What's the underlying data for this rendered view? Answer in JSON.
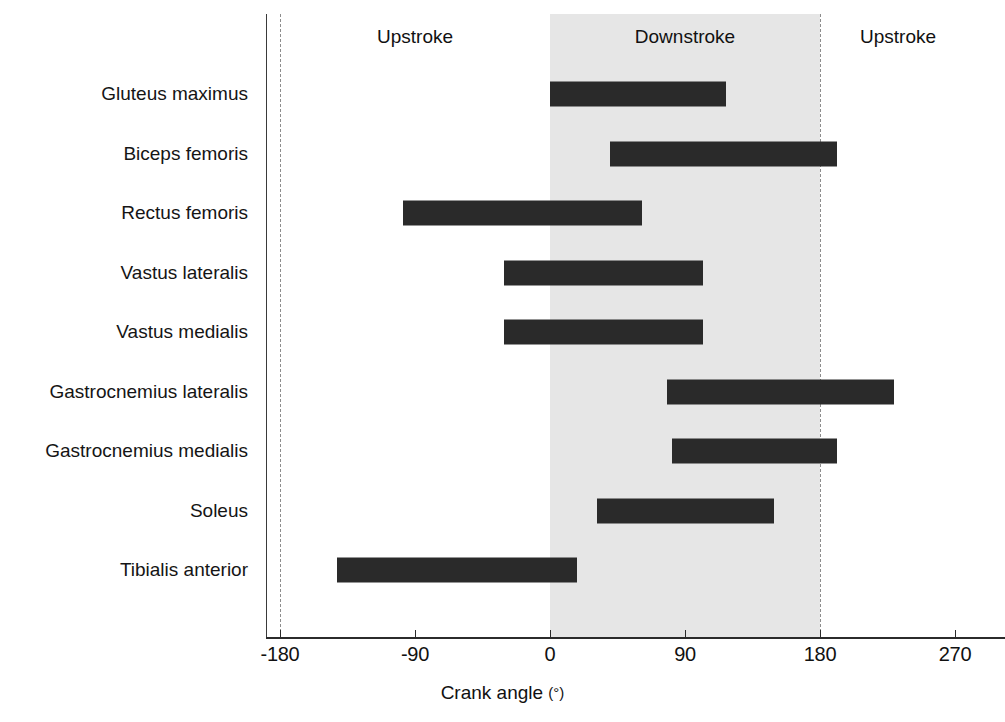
{
  "chart_data": {
    "type": "bar",
    "orientation": "horizontal-range",
    "title": "",
    "xlabel": "Crank angle (°)",
    "ylabel": "",
    "xlim": [
      -210,
      300
    ],
    "xticks": [
      -180,
      -90,
      0,
      90,
      180,
      270
    ],
    "xticklabels": [
      "-180",
      "-90",
      "0",
      "90",
      "180",
      "270"
    ],
    "grid": false,
    "legend": null,
    "categories": [
      "Gluteus maximus",
      "Biceps femoris",
      "Rectus femoris",
      "Vastus lateralis",
      "Vastus medialis",
      "Gastrocnemius lateralis",
      "Gastrocnemius medialis",
      "Soleus",
      "Tibialis anterior"
    ],
    "bars": [
      {
        "label": "Gluteus maximus",
        "start": 0,
        "end": 117
      },
      {
        "label": "Biceps femoris",
        "start": 40,
        "end": 191
      },
      {
        "label": "Rectus femoris",
        "start": -98,
        "end": 61
      },
      {
        "label": "Vastus lateralis",
        "start": -31,
        "end": 102
      },
      {
        "label": "Vastus medialis",
        "start": -31,
        "end": 102
      },
      {
        "label": "Gastrocnemius lateralis",
        "start": 78,
        "end": 229
      },
      {
        "label": "Gastrocnemius medialis",
        "start": 81,
        "end": 191
      },
      {
        "label": "Soleus",
        "start": 31,
        "end": 149
      },
      {
        "label": "Tibialis anterior",
        "start": -142,
        "end": 18
      }
    ],
    "annotations": [
      {
        "text": "Upstroke",
        "at": -90
      },
      {
        "text": "Downstroke",
        "at": 90
      },
      {
        "text": "Upstroke",
        "at": 232
      }
    ],
    "reference_lines": [
      -180,
      180
    ],
    "shaded_region": {
      "from": 0,
      "to": 180,
      "label": "Downstroke",
      "color": "#e6e6e6"
    },
    "bar_color": "#2a2a2a"
  },
  "axis": {
    "x_title_text": "Crank angle",
    "x_title_unit": "(°)"
  }
}
